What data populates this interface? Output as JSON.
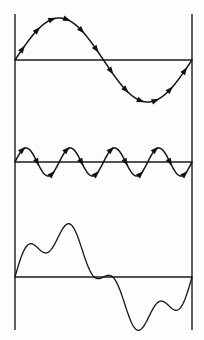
{
  "figure": {
    "background_color": "#fdfdfd",
    "stroke_color": "#141414",
    "axis_color": "#1a1a1a"
  },
  "frame": {
    "left_line_x": 15,
    "right_line_x": 192,
    "line_top_y": 14,
    "line_bottom_y": 330,
    "line_width": 1.4,
    "label_left": "left-boundary-line",
    "label_right": "right-boundary-line"
  },
  "panels": [
    {
      "name": "fundamental-wave-panel",
      "baseline_y": 60,
      "baseline_x_start": 15,
      "baseline_x_end": 192,
      "amplitude": 42,
      "cycles": 1,
      "phase": 0,
      "stroke_width": 1.5,
      "has_arrows": true,
      "arrow_count": 12,
      "arrow_size": 3.6,
      "description": "Fundamental sine wave, one complete cycle with direction arrowheads"
    },
    {
      "name": "harmonic-wave-panel",
      "baseline_y": 162,
      "baseline_x_start": 15,
      "baseline_x_end": 192,
      "amplitude": 14,
      "cycles": 4,
      "phase": 0,
      "stroke_width": 1.5,
      "has_arrows": true,
      "arrow_count": 12,
      "arrow_size": 3.6,
      "description": "Fourth harmonic sine wave, four complete cycles with direction arrowheads"
    },
    {
      "name": "composite-wave-panel",
      "baseline_y": 277,
      "baseline_x_start": 15,
      "baseline_x_end": 192,
      "amplitude": 42,
      "amplitude_secondary": 14,
      "cycles": 1,
      "cycles_secondary": 4,
      "phase": 0,
      "stroke_width": 1.3,
      "has_arrows": false,
      "arrow_count": 0,
      "description": "Composite waveform: sum of the fundamental and the fourth harmonic"
    }
  ],
  "chart_data": {
    "type": "line",
    "xlabel": "",
    "ylabel": "",
    "grid": false,
    "legend": "none",
    "x": [
      0,
      0.125,
      0.25,
      0.375,
      0.5,
      0.625,
      0.75,
      0.875,
      1
    ],
    "xlim": [
      0,
      1
    ],
    "series": [
      {
        "name": "Fundamental (1 cycle)",
        "amplitude": 42,
        "frequency": 1,
        "values": [
          0,
          29.7,
          42,
          29.7,
          0,
          -29.7,
          -42,
          -29.7,
          0
        ],
        "ylim": [
          -42,
          42
        ],
        "arrows": true
      },
      {
        "name": "Fourth harmonic (4 cycles)",
        "amplitude": 14,
        "frequency": 4,
        "values": [
          0,
          0,
          0,
          0,
          0,
          0,
          0,
          0,
          0
        ],
        "ylim": [
          -14,
          14
        ],
        "arrows": true
      },
      {
        "name": "Sum (fundamental + fourth harmonic)",
        "amplitude": 56,
        "frequency": 1,
        "values": [
          0,
          29.7,
          42,
          29.7,
          0,
          -29.7,
          -42,
          -29.7,
          0
        ],
        "ylim": [
          -56,
          56
        ],
        "arrows": false
      }
    ]
  }
}
